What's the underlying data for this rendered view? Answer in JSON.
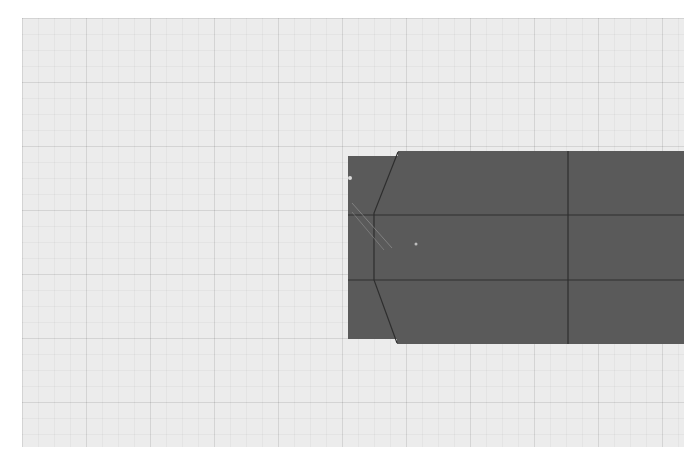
{
  "canvas": {
    "background_color": "#ececec",
    "grid_color": "#d6d6d6",
    "grid_minor_spacing_px": 16,
    "grid_major_spacing_px": 64
  },
  "shape": {
    "fill_color": "#5a5a5a",
    "edge_color": "#2e2e2e",
    "highlight_color": "#cfcfcf",
    "outline_points": "348,156 398,156 398,151 684,151 684,344 397,344 397,339 348,339",
    "inner_profile_points": "398,152 374,213 374,280 397,343",
    "horizontal_lines_y": [
      215,
      280
    ],
    "vertical_line_x": 568,
    "markers": [
      {
        "x": 350,
        "y": 178
      },
      {
        "x": 416,
        "y": 244
      }
    ]
  }
}
